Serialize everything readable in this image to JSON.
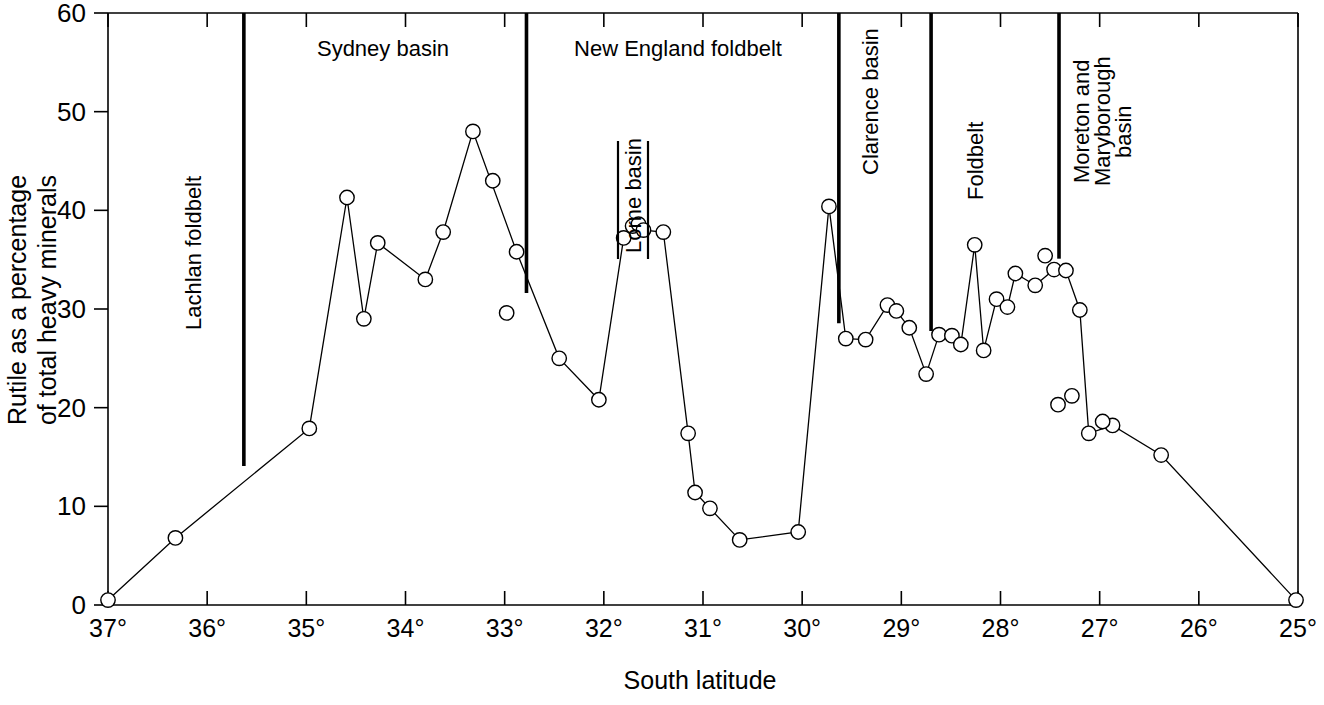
{
  "chart_data": {
    "type": "line",
    "title": "",
    "xlabel": "South latitude",
    "ylabel": "Rutile as a percentage of total heavy minerals",
    "ylabel_line1": "Rutile as a percentage",
    "ylabel_line2": "of total heavy minerals",
    "xlim": [
      37,
      25
    ],
    "ylim": [
      0,
      60
    ],
    "x_axis_inverted": true,
    "grid": false,
    "legend": "none",
    "xticks": [
      37,
      36,
      35,
      34,
      33,
      32,
      31,
      30,
      29,
      28,
      27,
      26,
      25
    ],
    "xtick_labels": [
      "37°",
      "36°",
      "35°",
      "34°",
      "33°",
      "32°",
      "31°",
      "30°",
      "29°",
      "28°",
      "27°",
      "26°",
      "25°"
    ],
    "yticks": [
      0,
      10,
      20,
      30,
      40,
      50,
      60
    ],
    "ytick_labels": [
      "0",
      "10",
      "20",
      "30",
      "40",
      "50",
      "60"
    ],
    "marker": "open-circle",
    "series": [
      {
        "name": "Rutile percentage along coast",
        "connected": true,
        "x": [
          37.0,
          36.32,
          34.97,
          34.59,
          34.42,
          34.28,
          33.8,
          33.62,
          33.32,
          32.88,
          32.45,
          32.05,
          31.8,
          31.71,
          31.65,
          31.6,
          31.4,
          31.15,
          31.08,
          30.93,
          30.63,
          30.04,
          29.73,
          29.56,
          29.36,
          29.14,
          29.05,
          28.92,
          28.75,
          28.62,
          28.49,
          28.4,
          28.26,
          28.17,
          28.04,
          27.93,
          27.85,
          27.65,
          27.46,
          27.34,
          27.2,
          27.11,
          26.87,
          26.38,
          25.02
        ],
        "y": [
          0.5,
          6.8,
          17.9,
          41.3,
          29.0,
          36.7,
          33.0,
          37.8,
          48.0,
          35.8,
          25.0,
          20.8,
          37.2,
          38.4,
          38.6,
          38.0,
          37.8,
          17.4,
          11.4,
          9.8,
          6.6,
          7.4,
          40.4,
          27.0,
          26.9,
          30.4,
          29.8,
          28.1,
          23.4,
          27.4,
          27.3,
          26.4,
          36.5,
          25.8,
          31.0,
          30.2,
          33.6,
          32.4,
          34.0,
          33.9,
          29.9,
          17.4,
          18.2,
          15.2,
          0.5
        ]
      },
      {
        "name": "Unconnected observations",
        "connected": false,
        "x": [
          33.12,
          32.98,
          27.55,
          27.42,
          27.28,
          26.97
        ],
        "y": [
          43.0,
          29.6,
          35.4,
          20.3,
          21.2,
          18.6
        ]
      }
    ],
    "region_dividers": [
      {
        "latitude": 35.63,
        "top_fraction": 0.0,
        "bottom_fraction": 0.765
      },
      {
        "latitude": 32.78,
        "top_fraction": 0.0,
        "bottom_fraction": 0.473
      },
      {
        "latitude": 29.63,
        "top_fraction": 0.0,
        "bottom_fraction": 0.524
      },
      {
        "latitude": 28.7,
        "top_fraction": 0.0,
        "bottom_fraction": 0.537
      },
      {
        "latitude": 27.41,
        "top_fraction": 0.0,
        "bottom_fraction": 0.415
      }
    ],
    "region_labels": [
      {
        "text": "Lachlan foldbelt",
        "orientation": "vertical",
        "x": 201,
        "y": 330
      },
      {
        "text": "Sydney basin",
        "orientation": "horizontal",
        "x": 383,
        "y": 56
      },
      {
        "text": "New England foldbelt",
        "orientation": "horizontal",
        "x": 678,
        "y": 56
      },
      {
        "text": "Lorne basin",
        "orientation": "vertical",
        "x": 633,
        "y": 200,
        "boxed": true
      },
      {
        "text": "Clarence basin",
        "orientation": "vertical",
        "x": 878,
        "y": 175
      },
      {
        "text": "Foldbelt",
        "orientation": "vertical",
        "x": 983,
        "y": 200
      },
      {
        "text": "Moreton and",
        "orientation": "vertical",
        "x": 1089,
        "y": 183
      },
      {
        "text": "Maryborough",
        "orientation": "vertical",
        "x": 1110,
        "y": 186
      },
      {
        "text": "basin",
        "orientation": "vertical",
        "x": 1131,
        "y": 158
      }
    ],
    "colors": {
      "axis": "#000000",
      "line": "#000000",
      "marker_fill": "#ffffff",
      "background": "#ffffff"
    }
  }
}
